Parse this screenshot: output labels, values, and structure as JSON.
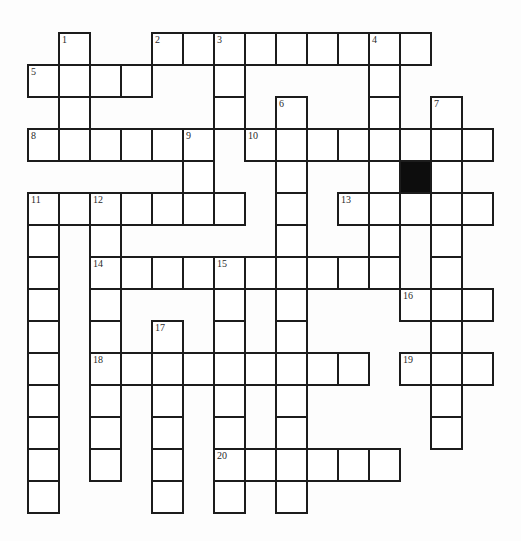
{
  "puzzle": {
    "type": "crossword",
    "grid": {
      "origin_x": 28,
      "origin_y": 33,
      "cell_width": 31,
      "cell_height": 32,
      "columns": 15,
      "rows": 15,
      "line_color": "#1c1c1c",
      "block_color": "#0d0d0d"
    },
    "entries": [
      {
        "number": "1",
        "direction": "down",
        "row": 0,
        "col": 1,
        "length": 4
      },
      {
        "number": "2",
        "direction": "across",
        "row": 0,
        "col": 4,
        "length": 9
      },
      {
        "number": "3",
        "direction": "down",
        "row": 0,
        "col": 6,
        "length": 3
      },
      {
        "number": "4",
        "direction": "down",
        "row": 0,
        "col": 11,
        "length": 8
      },
      {
        "number": "5",
        "direction": "across",
        "row": 1,
        "col": 0,
        "length": 4
      },
      {
        "number": "6",
        "direction": "down",
        "row": 2,
        "col": 8,
        "length": 13
      },
      {
        "number": "7",
        "direction": "down",
        "row": 2,
        "col": 13,
        "length": 11
      },
      {
        "number": "8",
        "direction": "across",
        "row": 3,
        "col": 0,
        "length": 6
      },
      {
        "number": "9",
        "direction": "down",
        "row": 3,
        "col": 5,
        "length": 3
      },
      {
        "number": "10",
        "direction": "across",
        "row": 3,
        "col": 7,
        "length": 8
      },
      {
        "number": "11",
        "direction": "across",
        "row": 5,
        "col": 0,
        "length": 7
      },
      {
        "number": "11",
        "direction": "down",
        "row": 5,
        "col": 0,
        "length": 10
      },
      {
        "number": "12",
        "direction": "down",
        "row": 5,
        "col": 2,
        "length": 9
      },
      {
        "number": "13",
        "direction": "across",
        "row": 5,
        "col": 10,
        "length": 5
      },
      {
        "number": "14",
        "direction": "across",
        "row": 7,
        "col": 2,
        "length": 10
      },
      {
        "number": "15",
        "direction": "down",
        "row": 7,
        "col": 6,
        "length": 8
      },
      {
        "number": "16",
        "direction": "across",
        "row": 8,
        "col": 12,
        "length": 3
      },
      {
        "number": "17",
        "direction": "down",
        "row": 9,
        "col": 4,
        "length": 6
      },
      {
        "number": "18",
        "direction": "across",
        "row": 10,
        "col": 2,
        "length": 9
      },
      {
        "number": "19",
        "direction": "across",
        "row": 10,
        "col": 12,
        "length": 3
      },
      {
        "number": "20",
        "direction": "across",
        "row": 13,
        "col": 6,
        "length": 6
      }
    ],
    "black_cells": [
      {
        "row": 4,
        "col": 12
      }
    ]
  }
}
